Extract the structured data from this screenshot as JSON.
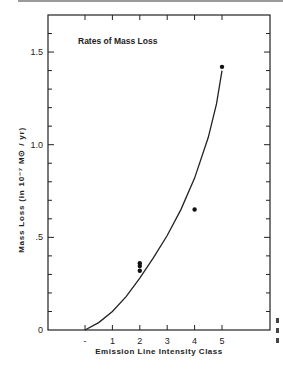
{
  "chart_data": {
    "type": "scatter",
    "title": "Rates of Mass Loss",
    "xlabel": "Emission Line Intensity Class",
    "ylabel": "Mass Loss  (in 10⁻⁷ M⊙ / yr)",
    "x_tick_labels": [
      "-",
      "1",
      "2",
      "3",
      "4",
      "5"
    ],
    "x_tick_values": [
      0,
      1,
      2,
      3,
      4,
      5
    ],
    "y_tick_labels": [
      "0",
      ".5",
      "1.0",
      "1.5"
    ],
    "y_tick_values": [
      0,
      0.5,
      1.0,
      1.5
    ],
    "xlim": [
      -1.35,
      6.7
    ],
    "ylim": [
      0,
      1.7
    ],
    "grid": false,
    "points": [
      {
        "x": 2,
        "y": 0.36
      },
      {
        "x": 2,
        "y": 0.345
      },
      {
        "x": 2,
        "y": 0.32
      },
      {
        "x": 4,
        "y": 0.65
      },
      {
        "x": 5,
        "y": 1.42
      }
    ],
    "curve": {
      "name": "fitted curve",
      "x": [
        0,
        0.5,
        1,
        1.5,
        2,
        2.5,
        3,
        3.5,
        4,
        4.5,
        4.8,
        5
      ],
      "y": [
        0.0,
        0.04,
        0.1,
        0.18,
        0.28,
        0.39,
        0.51,
        0.65,
        0.82,
        1.04,
        1.22,
        1.4
      ]
    }
  }
}
